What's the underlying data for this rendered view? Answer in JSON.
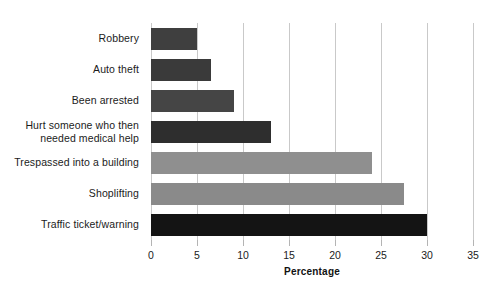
{
  "chart_data": {
    "type": "bar",
    "orientation": "horizontal",
    "title": "",
    "xlabel": "Percentage",
    "ylabel": "",
    "xlim": [
      0,
      35
    ],
    "xticks": [
      0,
      5,
      10,
      15,
      20,
      25,
      30,
      35
    ],
    "grid": true,
    "legend": "none",
    "categories": [
      "Robbery",
      "Auto theft",
      "Been arrested",
      "Hurt someone who then\nneeded medical help",
      "Trespassed into a building",
      "Shoplifting",
      "Traffic ticket/warning"
    ],
    "values": [
      5,
      6.5,
      9,
      13,
      24,
      27.5,
      30
    ],
    "bar_colors": [
      "#3f3f3f",
      "#3a3a3a",
      "#454545",
      "#2e2e2e",
      "#8f8f8f",
      "#8a8a8a",
      "#141414"
    ]
  },
  "axis": {
    "tick_labels": [
      "0",
      "5",
      "10",
      "15",
      "20",
      "25",
      "30",
      "35"
    ],
    "title": "Percentage"
  },
  "colors": {
    "background": "#ffffff",
    "gridline": "#c9c9c9",
    "tick": "#b4b4b4",
    "text": "#1b1b1b"
  }
}
